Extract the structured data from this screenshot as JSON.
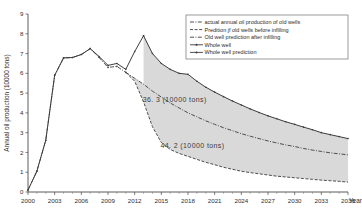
{
  "chart_data": {
    "type": "line",
    "title": "",
    "xlabel": "Year",
    "ylabel": "Annual oil production (10000 tons)",
    "xlim": [
      2000,
      2036
    ],
    "ylim": [
      0,
      9
    ],
    "ytick_step": 1,
    "xtick_step": 3,
    "grid": false,
    "legend_position": "top-right",
    "yticks": [
      "0",
      "1",
      "2",
      "3",
      "4",
      "5",
      "6",
      "7",
      "8",
      "9"
    ],
    "xticks": [
      "2000",
      "2003",
      "2006",
      "2009",
      "2012",
      "2015",
      "2018",
      "2021",
      "2024",
      "2027",
      "2030",
      "2033",
      "2036"
    ],
    "annotations": [
      {
        "text": "36. 3 (10000  tons)",
        "x": 2016.5,
        "y": 4.55
      },
      {
        "text": "44. 2 (10000  tons)",
        "x": 2018.5,
        "y": 2.25
      }
    ],
    "series": [
      {
        "name": "actual annual oil production of old wells",
        "style": "dash-dot",
        "x": [
          2000,
          2001,
          2002,
          2003,
          2004,
          2005,
          2006,
          2007,
          2008,
          2009,
          2010,
          2011
        ],
        "values": [
          0.1,
          1.05,
          2.62,
          5.9,
          6.78,
          6.8,
          6.95,
          7.25,
          6.8,
          6.3,
          6.35,
          6.05
        ]
      },
      {
        "name": "Prediction of old wells before infilling",
        "style": "dashed",
        "x": [
          2011,
          2012,
          2013,
          2014,
          2015,
          2016,
          2017,
          2018,
          2019,
          2020,
          2021,
          2022,
          2023,
          2024,
          2025,
          2026,
          2027,
          2028,
          2029,
          2030,
          2031,
          2032,
          2033,
          2034,
          2035,
          2036
        ],
        "values": [
          6.05,
          5.6,
          4.55,
          3.3,
          2.5,
          2.15,
          1.95,
          1.8,
          1.65,
          1.5,
          1.38,
          1.25,
          1.15,
          1.05,
          0.98,
          0.92,
          0.86,
          0.8,
          0.76,
          0.72,
          0.68,
          0.64,
          0.6,
          0.57,
          0.54,
          0.5
        ]
      },
      {
        "name": "Old well prediction after infilling",
        "style": "dash-dot",
        "x": [
          2011,
          2012,
          2013,
          2014,
          2015,
          2016,
          2017,
          2018,
          2019,
          2020,
          2021,
          2022,
          2023,
          2024,
          2025,
          2026,
          2027,
          2028,
          2029,
          2030,
          2031,
          2032,
          2033,
          2034,
          2035,
          2036
        ],
        "values": [
          6.05,
          5.75,
          5.45,
          5.1,
          4.8,
          4.5,
          4.25,
          4.0,
          3.8,
          3.6,
          3.42,
          3.25,
          3.1,
          2.95,
          2.82,
          2.7,
          2.58,
          2.48,
          2.38,
          2.3,
          2.2,
          2.12,
          2.05,
          1.98,
          1.93,
          1.88
        ]
      },
      {
        "name": "Whole well",
        "style": "solid-marker",
        "x": [
          2000,
          2001,
          2002,
          2003,
          2004,
          2005,
          2006,
          2007,
          2008,
          2009,
          2010,
          2011,
          2012,
          2013
        ],
        "values": [
          0.1,
          1.05,
          2.62,
          5.9,
          6.78,
          6.8,
          6.95,
          7.25,
          6.85,
          6.4,
          6.5,
          6.2,
          7.1,
          7.9
        ]
      },
      {
        "name": "Whole well prediction",
        "style": "solid-marker",
        "x": [
          2013,
          2014,
          2015,
          2016,
          2017,
          2018,
          2019,
          2020,
          2021,
          2022,
          2023,
          2024,
          2025,
          2026,
          2027,
          2028,
          2029,
          2030,
          2031,
          2032,
          2033,
          2034,
          2035,
          2036
        ],
        "values": [
          7.9,
          7.0,
          6.5,
          6.2,
          6.0,
          5.95,
          5.6,
          5.3,
          5.05,
          4.82,
          4.6,
          4.4,
          4.2,
          4.02,
          3.85,
          3.7,
          3.55,
          3.42,
          3.28,
          3.15,
          3.0,
          2.9,
          2.8,
          2.7
        ]
      }
    ]
  },
  "legend": {
    "items": [
      {
        "label": "actual annual oil production of old wells",
        "marker": "dash-dot-line"
      },
      {
        "label": "Predition jf old wells before infilling",
        "marker": "dashed-line"
      },
      {
        "label": "Old well prediction after infilling",
        "marker": "dash-dot-line"
      },
      {
        "label": "Whole well",
        "marker": "solid-line-marker"
      },
      {
        "label": "Whole well prediction",
        "marker": "solid-line-marker"
      }
    ]
  }
}
